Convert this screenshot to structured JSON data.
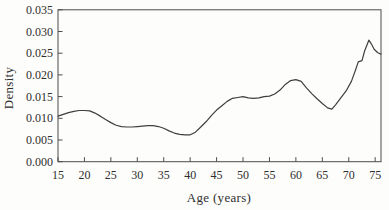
{
  "figure": {
    "background": "#fdfdfb",
    "frame_color": "#4d4d4d",
    "text_color": "#2e2e2e"
  },
  "chart_data": {
    "type": "line",
    "title": "",
    "xlabel": "Age (years)",
    "ylabel": "Density",
    "xlim": [
      15,
      76.1
    ],
    "ylim": [
      0,
      0.035
    ],
    "grid": false,
    "legend": "none",
    "x_ticks": [
      15,
      20,
      25,
      30,
      35,
      40,
      45,
      50,
      55,
      60,
      65,
      70,
      75
    ],
    "y_ticks": [
      {
        "value": 0.0,
        "label": "0.000"
      },
      {
        "value": 0.005,
        "label": "0.005"
      },
      {
        "value": 0.01,
        "label": "0.010"
      },
      {
        "value": 0.015,
        "label": "0.015"
      },
      {
        "value": 0.02,
        "label": "0.020"
      },
      {
        "value": 0.025,
        "label": "0.025"
      },
      {
        "value": 0.03,
        "label": "0.030"
      },
      {
        "value": 0.035,
        "label": "0.035"
      }
    ],
    "line_color": "#3f3f3f",
    "series": [
      {
        "name": "density-curve",
        "points": [
          [
            15,
            0.0105
          ],
          [
            16,
            0.0109
          ],
          [
            17,
            0.0113
          ],
          [
            18,
            0.0116
          ],
          [
            19,
            0.0118
          ],
          [
            20,
            0.0118
          ],
          [
            21,
            0.0117
          ],
          [
            22,
            0.0112
          ],
          [
            23,
            0.0105
          ],
          [
            24,
            0.0097
          ],
          [
            25,
            0.009
          ],
          [
            26,
            0.0084
          ],
          [
            27,
            0.0081
          ],
          [
            28,
            0.008
          ],
          [
            29,
            0.008
          ],
          [
            30,
            0.0081
          ],
          [
            31,
            0.0082
          ],
          [
            32,
            0.0083
          ],
          [
            33,
            0.0083
          ],
          [
            34,
            0.0081
          ],
          [
            35,
            0.0077
          ],
          [
            36,
            0.0071
          ],
          [
            37,
            0.0066
          ],
          [
            38,
            0.0063
          ],
          [
            39,
            0.0062
          ],
          [
            40,
            0.0062
          ],
          [
            41,
            0.0068
          ],
          [
            42,
            0.008
          ],
          [
            43,
            0.0092
          ],
          [
            44,
            0.0106
          ],
          [
            45,
            0.0119
          ],
          [
            46,
            0.0129
          ],
          [
            47,
            0.0139
          ],
          [
            48,
            0.0146
          ],
          [
            49,
            0.0148
          ],
          [
            50,
            0.015
          ],
          [
            51,
            0.0147
          ],
          [
            52,
            0.0146
          ],
          [
            53,
            0.0147
          ],
          [
            54,
            0.015
          ],
          [
            55,
            0.0151
          ],
          [
            56,
            0.0156
          ],
          [
            57,
            0.0165
          ],
          [
            58,
            0.0178
          ],
          [
            59,
            0.0187
          ],
          [
            60,
            0.0189
          ],
          [
            61,
            0.0185
          ],
          [
            62,
            0.017
          ],
          [
            63,
            0.0157
          ],
          [
            64,
            0.0145
          ],
          [
            65,
            0.0134
          ],
          [
            66,
            0.0124
          ],
          [
            66.8,
            0.0121
          ],
          [
            67.5,
            0.0131
          ],
          [
            68.5,
            0.0147
          ],
          [
            69.5,
            0.0163
          ],
          [
            70.5,
            0.0185
          ],
          [
            71.3,
            0.0212
          ],
          [
            71.8,
            0.023
          ],
          [
            72.5,
            0.0233
          ],
          [
            73,
            0.0255
          ],
          [
            73.8,
            0.028
          ],
          [
            74.3,
            0.0271
          ],
          [
            74.8,
            0.0259
          ],
          [
            75.5,
            0.0251
          ],
          [
            76.1,
            0.0248
          ]
        ]
      }
    ]
  }
}
